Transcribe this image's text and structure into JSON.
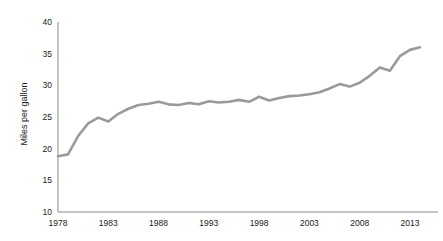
{
  "chart_data": {
    "type": "line",
    "title": "",
    "subtitle": "",
    "xlabel": "",
    "ylabel": "Miles per gallon",
    "xlim": [
      1978,
      2014
    ],
    "ylim": [
      10,
      40
    ],
    "grid": false,
    "legend": null,
    "legend_position": "none",
    "line_color": "#9a9a9a",
    "axis_color": "#8c8c8c",
    "text_color": "#1a1a1a",
    "x_ticks": [
      1978,
      1983,
      1988,
      1993,
      1998,
      2003,
      2008,
      2013
    ],
    "x_tick_labels": [
      "1978",
      "1983",
      "1988",
      "1993",
      "1998",
      "2003",
      "2008",
      "2013"
    ],
    "y_ticks": [
      10,
      15,
      20,
      25,
      30,
      35,
      40
    ],
    "y_tick_labels": [
      "10",
      "15",
      "20",
      "25",
      "30",
      "35",
      "40"
    ],
    "x": [
      1978,
      1979,
      1980,
      1981,
      1982,
      1983,
      1984,
      1985,
      1986,
      1987,
      1988,
      1989,
      1990,
      1991,
      1992,
      1993,
      1994,
      1995,
      1996,
      1997,
      1998,
      1999,
      2000,
      2001,
      2002,
      2003,
      2004,
      2005,
      2006,
      2007,
      2008,
      2009,
      2010,
      2011,
      2012,
      2013,
      2014
    ],
    "values": [
      18.8,
      19.1,
      22.0,
      24.0,
      24.9,
      24.3,
      25.5,
      26.3,
      26.9,
      27.1,
      27.4,
      27.0,
      26.9,
      27.2,
      27.0,
      27.5,
      27.3,
      27.4,
      27.7,
      27.4,
      28.2,
      27.6,
      28.0,
      28.3,
      28.4,
      28.6,
      28.9,
      29.5,
      30.2,
      29.8,
      30.4,
      31.5,
      32.8,
      32.3,
      34.6,
      35.6,
      36.0
    ],
    "series": [
      {
        "name": "Miles per gallon",
        "values": [
          18.8,
          19.1,
          22.0,
          24.0,
          24.9,
          24.3,
          25.5,
          26.3,
          26.9,
          27.1,
          27.4,
          27.0,
          26.9,
          27.2,
          27.0,
          27.5,
          27.3,
          27.4,
          27.7,
          27.4,
          28.2,
          27.6,
          28.0,
          28.3,
          28.4,
          28.6,
          28.9,
          29.5,
          30.2,
          29.8,
          30.4,
          31.5,
          32.8,
          32.3,
          34.6,
          35.6,
          36.0
        ]
      }
    ]
  }
}
